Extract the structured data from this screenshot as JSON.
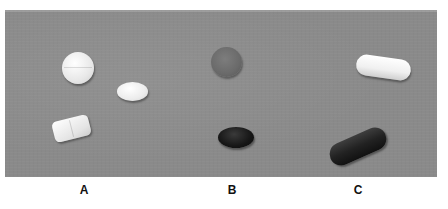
{
  "figure": {
    "background_color": "#8a8a8a",
    "panels": [
      {
        "label": "A",
        "items": [
          {
            "shape": "round-tablet",
            "color": "white",
            "scored": true
          },
          {
            "shape": "oval-tablet",
            "color": "white"
          },
          {
            "shape": "rectangular-scored-tablet",
            "color": "white",
            "scored": true
          }
        ]
      },
      {
        "label": "B",
        "items": [
          {
            "shape": "round-coated-tablet",
            "color": "brown"
          },
          {
            "shape": "oval-softgel",
            "color": "black"
          }
        ]
      },
      {
        "label": "C",
        "items": [
          {
            "shape": "capsule",
            "color": "white"
          },
          {
            "shape": "capsule",
            "color": "dark"
          }
        ]
      }
    ]
  }
}
